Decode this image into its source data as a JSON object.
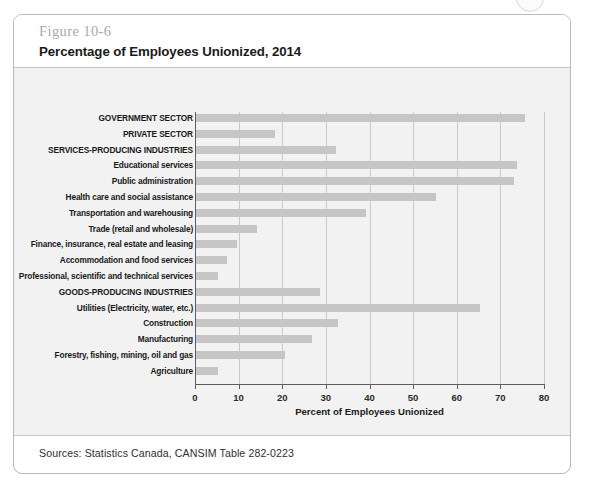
{
  "figure": {
    "number": "Figure 10-6",
    "title": "Percentage of Employees Unionized, 2014",
    "source": "Sources: Statistics Canada, CANSIM Table 282-0223"
  },
  "colors": {
    "bar": "#c6c6c6",
    "panel_background": "#f2f2f2",
    "gridline": "#c9c9c9",
    "axis": "#5c5c5c",
    "figure_number": "#a9a9a9",
    "frame_border": "#b9b9b9"
  },
  "chart_data": {
    "type": "bar",
    "orientation": "horizontal",
    "title": "Percentage of Employees Unionized, 2014",
    "xlabel": "Percent of Employees Unionized",
    "ylabel": "",
    "xlim": [
      0,
      80
    ],
    "xticks": [
      0,
      10,
      20,
      30,
      40,
      50,
      60,
      70,
      80
    ],
    "grid": true,
    "legend": "none",
    "categories": [
      "GOVERNMENT SECTOR",
      "PRIVATE SECTOR",
      "SERVICES-PRODUCING INDUSTRIES",
      "Educational services",
      "Public administration",
      "Health care and social assistance",
      "Transportation and warehousing",
      "Trade (retail and wholesale)",
      "Finance, insurance, real estate and leasing",
      "Accommodation and food services",
      "Professional, scientific and technical services",
      "GOODS-PRODUCING INDUSTRIES",
      "Utilities (Electricity, water, etc.)",
      "Construction",
      "Manufacturing",
      "Forestry, fishing, mining, oil and gas",
      "Agriculture"
    ],
    "values": [
      75.5,
      18.0,
      32.0,
      73.5,
      73.0,
      55.0,
      39.0,
      14.0,
      9.5,
      7.0,
      5.0,
      28.5,
      65.0,
      32.5,
      26.5,
      20.5,
      5.0
    ]
  }
}
